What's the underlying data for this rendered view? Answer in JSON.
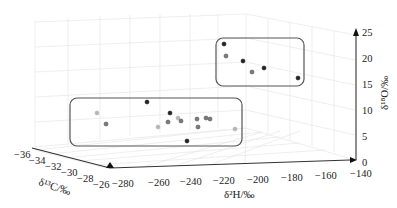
{
  "chart_data": {
    "type": "scatter3d",
    "title": "",
    "xlabel": "δ²H/‰",
    "ylabel": "δ¹³C/‰",
    "zlabel": "δ¹⁸O/‰",
    "x_ticks": [
      "−280",
      "−260",
      "−240",
      "−220",
      "−200",
      "−180",
      "−160",
      "−140"
    ],
    "y_ticks": [
      "−36",
      "−34",
      "−32",
      "−30",
      "−28",
      "−26"
    ],
    "z_ticks": [
      "0",
      "5",
      "10",
      "15",
      "20",
      "25"
    ],
    "xlim": [
      -280,
      -140
    ],
    "ylim": [
      -36,
      -26
    ],
    "zlim": [
      0,
      25
    ],
    "grid": true,
    "groups": [
      {
        "name": "upper-cluster",
        "enclosed": true,
        "points_screen": [
          {
            "x": 224,
            "y": 44,
            "shade": "dark"
          },
          {
            "x": 226,
            "y": 56,
            "shade": "gray"
          },
          {
            "x": 243,
            "y": 61,
            "shade": "dark"
          },
          {
            "x": 252,
            "y": 72,
            "shade": "gray"
          },
          {
            "x": 264,
            "y": 68,
            "shade": "dark"
          },
          {
            "x": 298,
            "y": 78,
            "shade": "dark"
          }
        ]
      },
      {
        "name": "lower-cluster",
        "enclosed": true,
        "points_screen": [
          {
            "x": 97,
            "y": 113,
            "shade": "light"
          },
          {
            "x": 106,
            "y": 124,
            "shade": "gray"
          },
          {
            "x": 147,
            "y": 102,
            "shade": "dark"
          },
          {
            "x": 158,
            "y": 127,
            "shade": "light"
          },
          {
            "x": 168,
            "y": 122,
            "shade": "gray"
          },
          {
            "x": 170,
            "y": 113,
            "shade": "dark"
          },
          {
            "x": 178,
            "y": 118,
            "shade": "light"
          },
          {
            "x": 181,
            "y": 121,
            "shade": "gray"
          },
          {
            "x": 197,
            "y": 119,
            "shade": "gray"
          },
          {
            "x": 198,
            "y": 127,
            "shade": "gray"
          },
          {
            "x": 206,
            "y": 118,
            "shade": "gray"
          },
          {
            "x": 210,
            "y": 119,
            "shade": "gray"
          },
          {
            "x": 187,
            "y": 141,
            "shade": "dark"
          },
          {
            "x": 235,
            "y": 129,
            "shade": "light"
          }
        ]
      }
    ],
    "colors": {
      "dark": "#222222",
      "gray": "#7a7a7a",
      "light": "#b5b5b5",
      "box": "#555555"
    }
  }
}
